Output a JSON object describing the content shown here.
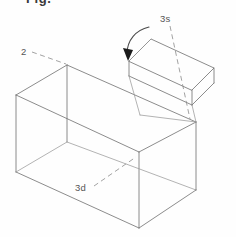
{
  "figure": {
    "kind": "isometric-line-drawing",
    "background_color": "#fefefe",
    "line_color": "#6e6e6e",
    "leader_color": "#8a8a8a",
    "arrow_color": "#1b1b1b",
    "clipped_heading": "Fig.",
    "labels": [
      {
        "id": "label-2",
        "text": "2",
        "x": 22,
        "y": 55,
        "leader_from": [
          32,
          52
        ],
        "leader_to": [
          66,
          64
        ],
        "refers_to": "main box body"
      },
      {
        "id": "label-3d",
        "text": "3d",
        "x": 76,
        "y": 190,
        "leader_from": [
          94,
          186
        ],
        "leader_to": [
          136,
          157
        ],
        "refers_to": "box bottom / deep face"
      },
      {
        "id": "label-3s",
        "text": "3s",
        "x": 162,
        "y": 20,
        "leader_from": [
          170,
          25
        ],
        "leader_to": [
          190,
          120
        ],
        "refers_to": "lid side face"
      }
    ],
    "rotation_arrow": {
      "id": "rotation-arrow",
      "direction": "counter-clockwise",
      "tip": [
        125,
        48
      ],
      "arc_start": [
        126,
        52
      ],
      "arc_end": [
        148,
        28
      ]
    },
    "main_box": {
      "name": "main-box",
      "front_top_left": [
        16,
        95
      ],
      "front_top_right": [
        139,
        152
      ],
      "front_bottom_left": [
        16,
        172
      ],
      "front_bottom_right": [
        139,
        228
      ],
      "back_top_left": [
        67,
        65
      ],
      "back_top_right": [
        196,
        122
      ],
      "back_bottom_right": [
        196,
        190
      ]
    },
    "lid_box": {
      "name": "lid-box",
      "top_front_left": [
        129,
        61
      ],
      "top_back_left": [
        151,
        39
      ],
      "top_back_right": [
        214,
        68
      ],
      "top_front_right": [
        192,
        90
      ],
      "bottom_front_left": [
        129,
        76
      ],
      "bottom_front_right": [
        192,
        105
      ],
      "bottom_back_right": [
        214,
        83
      ]
    }
  }
}
